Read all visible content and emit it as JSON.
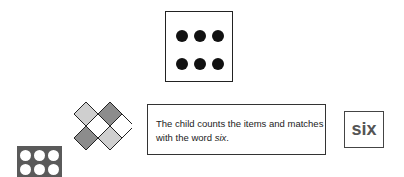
{
  "dice": {
    "label": "six dots",
    "dots": 6
  },
  "caption": {
    "text_before": "The child counts the items and matches with the word ",
    "emphasis": "six",
    "text_after": "."
  },
  "word_card": {
    "word": "six"
  },
  "colors": {
    "light_gray": "#cfcfcf",
    "mid_gray": "#8c8c8c",
    "dark_gray": "#5a5a5a",
    "border": "#222222"
  }
}
